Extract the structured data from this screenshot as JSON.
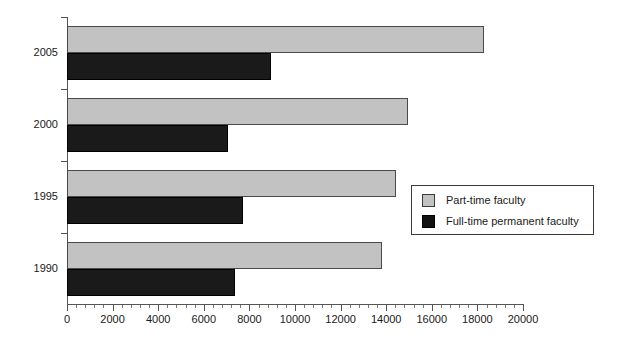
{
  "chart_data": {
    "type": "bar",
    "orientation": "horizontal",
    "title": "",
    "xlabel": "",
    "ylabel": "",
    "categories": [
      "2005",
      "2000",
      "1995",
      "1990"
    ],
    "series": [
      {
        "name": "Part-time faculty",
        "color": "#c2c2c2",
        "values": [
          18300,
          14950,
          14450,
          13800
        ]
      },
      {
        "name": "Full-time permanent faculty",
        "color": "#1a1a1a",
        "values": [
          8950,
          7050,
          7700,
          7350
        ]
      }
    ],
    "xlim": [
      0,
      20000
    ],
    "xticks": [
      0,
      2000,
      4000,
      6000,
      8000,
      10000,
      12000,
      14000,
      16000,
      18000,
      20000
    ],
    "xtick_labels": [
      "0",
      "2000",
      "4000",
      "6000",
      "8000",
      "10000",
      "12000",
      "14000",
      "16000",
      "18000",
      "20000"
    ],
    "minor_tick_interval": 400,
    "grid": false,
    "legend_position": "center-right"
  },
  "legend": {
    "entries": [
      {
        "label": "Part-time faculty",
        "swatch": "part-time"
      },
      {
        "label": "Full-time permanent faculty",
        "swatch": "full-time"
      }
    ]
  }
}
